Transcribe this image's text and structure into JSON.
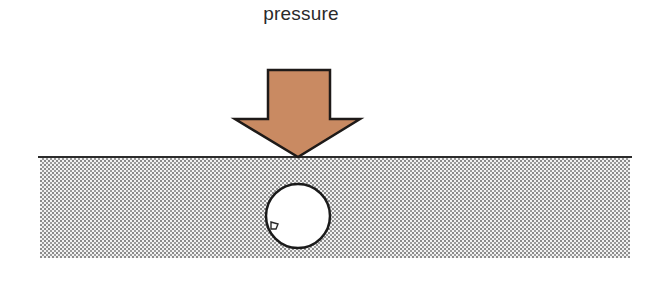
{
  "diagram": {
    "label": "pressure",
    "colors": {
      "arrow_fill": "#c98a62",
      "arrow_stroke": "#1e1a18",
      "ground_line": "#2b2b2b",
      "stipple_dot": "#8a8a8a",
      "stipple_bg": "#f2f2f2",
      "cavity_fill": "#ffffff",
      "cavity_stroke": "#1a1a1a"
    },
    "elements": [
      {
        "name": "pressure-arrow",
        "type": "down-arrow"
      },
      {
        "name": "ground-surface",
        "type": "line"
      },
      {
        "name": "substrate",
        "type": "stippled-rectangle"
      },
      {
        "name": "embedded-vessel",
        "type": "circle",
        "mark": "d"
      }
    ]
  }
}
